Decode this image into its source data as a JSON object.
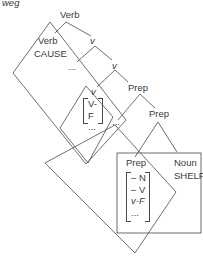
{
  "example_label": "weg",
  "tree": {
    "root": "Verb",
    "verb_head": "Verb",
    "verb_head_value": "CAUSE",
    "v1": "v",
    "ellipsis1": "...",
    "v2": "v",
    "v3": "v",
    "v3_matrix": [
      "V-F",
      "..."
    ],
    "ellipsis2": "...",
    "prep1": "Prep",
    "prep2": "Prep",
    "prep_head": "Prep",
    "prep_head_matrix": [
      "– N",
      "– V",
      "v-F",
      "..."
    ],
    "noun": "Noun",
    "noun_value": "SHELF"
  }
}
